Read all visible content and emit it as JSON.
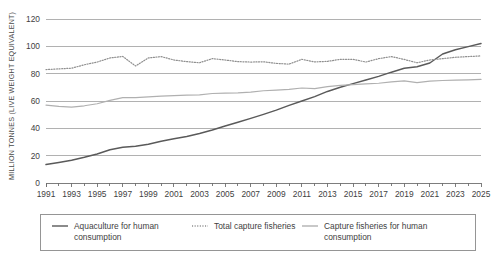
{
  "chart_data": {
    "type": "line",
    "title": "",
    "xlabel": "",
    "ylabel": "MILLION TONNES (LIVE WEIGHT EQUIVALENT)",
    "xlim": [
      1991,
      2025
    ],
    "ylim": [
      0,
      120
    ],
    "ytick_step": 20,
    "yticks": [
      0,
      20,
      40,
      60,
      80,
      100,
      120
    ],
    "ytick_labels": [
      "0",
      "20",
      "40",
      "60",
      "80",
      "100",
      "120"
    ],
    "xticks": [
      1991,
      1993,
      1995,
      1997,
      1999,
      2001,
      2003,
      2005,
      2007,
      2009,
      2011,
      2013,
      2015,
      2017,
      2019,
      2021,
      2023,
      2025
    ],
    "xtick_labels": [
      "1991",
      "1993",
      "1995",
      "1997",
      "1999",
      "2001",
      "2003",
      "2005",
      "2007",
      "2009",
      "2011",
      "2013",
      "2015",
      "2017",
      "2019",
      "2021",
      "2023",
      "2025"
    ],
    "xtick_minor_step": 1,
    "grid": "horizontal",
    "legend_position": "bottom",
    "x": [
      1991,
      1992,
      1993,
      1994,
      1995,
      1996,
      1997,
      1998,
      1999,
      2000,
      2001,
      2002,
      2003,
      2004,
      2005,
      2006,
      2007,
      2008,
      2009,
      2010,
      2011,
      2012,
      2013,
      2014,
      2015,
      2016,
      2017,
      2018,
      2019,
      2020,
      2021,
      2022,
      2023,
      2024,
      2025
    ],
    "series": [
      {
        "name": "Aquaculture for human consumption",
        "color": "#5a5a5a",
        "style": "solid",
        "width": 1.5,
        "values": [
          13.5,
          15.0,
          16.7,
          18.8,
          21.2,
          24.3,
          26.2,
          26.9,
          28.3,
          30.5,
          32.3,
          34.0,
          36.2,
          38.8,
          41.7,
          44.5,
          47.3,
          50.2,
          53.3,
          56.8,
          60.0,
          63.2,
          67.0,
          70.0,
          72.7,
          75.3,
          78.0,
          81.1,
          83.9,
          85.1,
          87.8,
          94.4,
          97.5,
          99.8,
          102.0
        ]
      },
      {
        "name": "Total capture fisheries",
        "color": "#8f8f8f",
        "style": "dotted",
        "width": 1.2,
        "values": [
          83.0,
          83.5,
          84.0,
          86.5,
          88.5,
          91.5,
          92.6,
          85.6,
          91.5,
          92.5,
          90.0,
          88.8,
          88.0,
          91.0,
          90.0,
          88.8,
          88.5,
          88.7,
          87.5,
          87.0,
          90.5,
          88.6,
          89.0,
          90.5,
          90.5,
          88.5,
          91.0,
          92.5,
          90.4,
          88.0,
          90.0,
          91.0,
          92.0,
          92.5,
          93.0
        ]
      },
      {
        "name": "Capture fisheries for human consumption",
        "color": "#b0b0b0",
        "style": "solid",
        "width": 1.2,
        "values": [
          57.0,
          56.0,
          55.5,
          56.5,
          58.0,
          60.5,
          62.5,
          62.5,
          63.0,
          63.5,
          64.0,
          64.3,
          64.5,
          65.5,
          65.8,
          66.0,
          66.5,
          67.5,
          68.0,
          68.5,
          69.5,
          69.0,
          70.5,
          71.5,
          72.0,
          72.5,
          73.0,
          74.0,
          74.7,
          73.5,
          74.5,
          75.0,
          75.3,
          75.5,
          75.8
        ]
      }
    ],
    "legend": [
      {
        "label": "Aquaculture for human consumption",
        "color": "#5a5a5a",
        "style": "solid"
      },
      {
        "label": "Total capture fisheries",
        "color": "#8f8f8f",
        "style": "dotted"
      },
      {
        "label": "Capture fisheries for human consumption",
        "color": "#b0b0b0",
        "style": "solid"
      }
    ]
  }
}
